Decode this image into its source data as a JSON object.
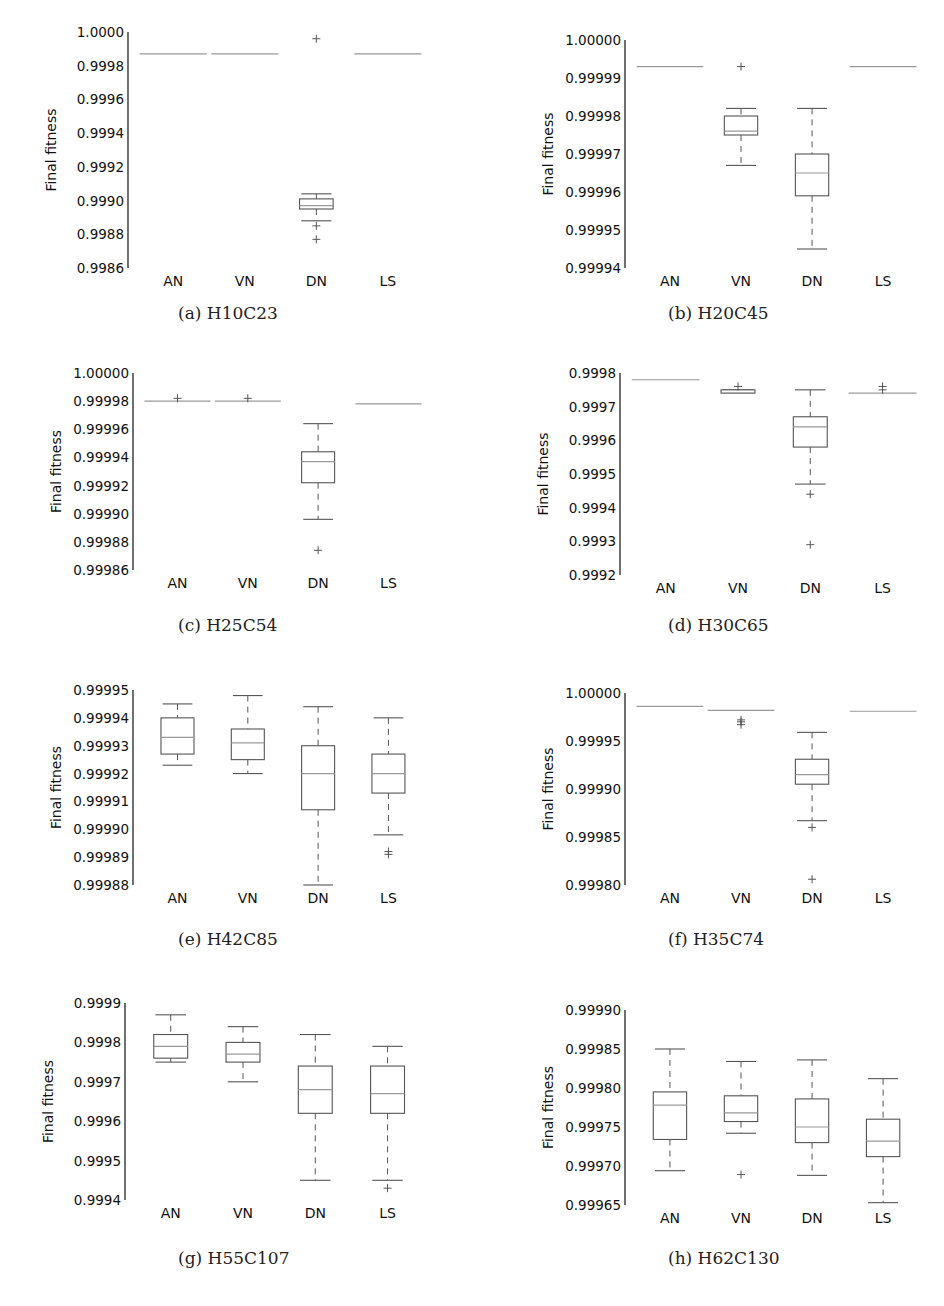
{
  "chart_data": [
    {
      "id": "a",
      "type": "box",
      "caption": "(a) H10C23",
      "ylabel": "Final fitness",
      "categories": [
        "AN",
        "VN",
        "DN",
        "LS"
      ],
      "yticks": [
        "0.9986",
        "0.9988",
        "0.9990",
        "0.9992",
        "0.9994",
        "0.9996",
        "0.9998",
        "1.0000"
      ],
      "ylim": [
        0.9986,
        1.0
      ],
      "boxes": [
        {
          "cat": "AN",
          "min": 0.99987,
          "q1": 0.99987,
          "median": 0.99987,
          "q3": 0.99987,
          "max": 0.99987,
          "outliers": []
        },
        {
          "cat": "VN",
          "min": 0.99987,
          "q1": 0.99987,
          "median": 0.99987,
          "q3": 0.99987,
          "max": 0.99987,
          "outliers": []
        },
        {
          "cat": "DN",
          "min": 0.99888,
          "q1": 0.99895,
          "median": 0.99897,
          "q3": 0.99901,
          "max": 0.99904,
          "outliers": [
            0.99885,
            0.99877,
            0.99996
          ]
        },
        {
          "cat": "LS",
          "min": 0.99987,
          "q1": 0.99987,
          "median": 0.99987,
          "q3": 0.99987,
          "max": 0.99987,
          "outliers": []
        }
      ]
    },
    {
      "id": "b",
      "type": "box",
      "caption": "(b) H20C45",
      "ylabel": "Final fitness",
      "categories": [
        "AN",
        "VN",
        "DN",
        "LS"
      ],
      "yticks": [
        "0.99994",
        "0.99995",
        "0.99996",
        "0.99997",
        "0.99998",
        "0.99999",
        "1.00000"
      ],
      "ylim": [
        0.99994,
        1.0
      ],
      "boxes": [
        {
          "cat": "AN",
          "min": 0.999993,
          "q1": 0.999993,
          "median": 0.999993,
          "q3": 0.999993,
          "max": 0.999993,
          "outliers": []
        },
        {
          "cat": "VN",
          "min": 0.999967,
          "q1": 0.999975,
          "median": 0.999976,
          "q3": 0.99998,
          "max": 0.999982,
          "outliers": [
            0.999993
          ]
        },
        {
          "cat": "DN",
          "min": 0.999945,
          "q1": 0.999959,
          "median": 0.999965,
          "q3": 0.99997,
          "max": 0.999982,
          "outliers": []
        },
        {
          "cat": "LS",
          "min": 0.999993,
          "q1": 0.999993,
          "median": 0.999993,
          "q3": 0.999993,
          "max": 0.999993,
          "outliers": []
        }
      ]
    },
    {
      "id": "c",
      "type": "box",
      "caption": "(c) H25C54",
      "ylabel": "Final fitness",
      "categories": [
        "AN",
        "VN",
        "DN",
        "LS"
      ],
      "yticks": [
        "0.99986",
        "0.99988",
        "0.99990",
        "0.99992",
        "0.99994",
        "0.99996",
        "0.99998",
        "1.00000"
      ],
      "ylim": [
        0.99986,
        1.0
      ],
      "boxes": [
        {
          "cat": "AN",
          "min": 0.99998,
          "q1": 0.99998,
          "median": 0.99998,
          "q3": 0.99998,
          "max": 0.99998,
          "outliers": [
            0.999982
          ]
        },
        {
          "cat": "VN",
          "min": 0.99998,
          "q1": 0.99998,
          "median": 0.99998,
          "q3": 0.99998,
          "max": 0.99998,
          "outliers": [
            0.999982
          ]
        },
        {
          "cat": "DN",
          "min": 0.999896,
          "q1": 0.999922,
          "median": 0.999937,
          "q3": 0.999944,
          "max": 0.999964,
          "outliers": [
            0.999874
          ]
        },
        {
          "cat": "LS",
          "min": 0.999978,
          "q1": 0.999978,
          "median": 0.999978,
          "q3": 0.999978,
          "max": 0.999978,
          "outliers": []
        }
      ]
    },
    {
      "id": "d",
      "type": "box",
      "caption": "(d) H30C65",
      "ylabel": "Final fitness",
      "categories": [
        "AN",
        "VN",
        "DN",
        "LS"
      ],
      "yticks": [
        "0.9992",
        "0.9993",
        "0.9994",
        "0.9995",
        "0.9996",
        "0.9997",
        "0.9998"
      ],
      "ylim": [
        0.9992,
        0.9998
      ],
      "boxes": [
        {
          "cat": "AN",
          "min": 0.99978,
          "q1": 0.99978,
          "median": 0.99978,
          "q3": 0.99978,
          "max": 0.99978,
          "outliers": []
        },
        {
          "cat": "VN",
          "min": 0.99974,
          "q1": 0.99974,
          "median": 0.99974,
          "q3": 0.99975,
          "max": 0.99975,
          "outliers": [
            0.99976
          ]
        },
        {
          "cat": "DN",
          "min": 0.99947,
          "q1": 0.99958,
          "median": 0.99964,
          "q3": 0.99967,
          "max": 0.99975,
          "outliers": [
            0.99944,
            0.99929
          ]
        },
        {
          "cat": "LS",
          "min": 0.99974,
          "q1": 0.99974,
          "median": 0.99974,
          "q3": 0.99974,
          "max": 0.99974,
          "outliers": [
            0.99976,
            0.99975
          ]
        }
      ]
    },
    {
      "id": "e",
      "type": "box",
      "caption": "(e) H42C85",
      "ylabel": "Final fitness",
      "categories": [
        "AN",
        "VN",
        "DN",
        "LS"
      ],
      "yticks": [
        "0.99988",
        "0.99989",
        "0.99990",
        "0.99991",
        "0.99992",
        "0.99993",
        "0.99994",
        "0.99995"
      ],
      "ylim": [
        0.99988,
        0.99995
      ],
      "boxes": [
        {
          "cat": "AN",
          "min": 0.999923,
          "q1": 0.999927,
          "median": 0.999933,
          "q3": 0.99994,
          "max": 0.999945,
          "outliers": []
        },
        {
          "cat": "VN",
          "min": 0.99992,
          "q1": 0.999925,
          "median": 0.999931,
          "q3": 0.999936,
          "max": 0.999948,
          "outliers": []
        },
        {
          "cat": "DN",
          "min": 0.99988,
          "q1": 0.999907,
          "median": 0.99992,
          "q3": 0.99993,
          "max": 0.999944,
          "outliers": []
        },
        {
          "cat": "LS",
          "min": 0.999898,
          "q1": 0.999913,
          "median": 0.99992,
          "q3": 0.999927,
          "max": 0.99994,
          "outliers": [
            0.999892,
            0.999891
          ]
        }
      ]
    },
    {
      "id": "f",
      "type": "box",
      "caption": "(f) H35C74",
      "ylabel": "Final fitness",
      "categories": [
        "AN",
        "VN",
        "DN",
        "LS"
      ],
      "yticks": [
        "0.99980",
        "0.99985",
        "0.99990",
        "0.99995",
        "1.00000"
      ],
      "ylim": [
        0.9998,
        1.0
      ],
      "boxes": [
        {
          "cat": "AN",
          "min": 0.999986,
          "q1": 0.999986,
          "median": 0.999986,
          "q3": 0.999986,
          "max": 0.999986,
          "outliers": []
        },
        {
          "cat": "VN",
          "min": 0.999982,
          "q1": 0.999982,
          "median": 0.999982,
          "q3": 0.999982,
          "max": 0.999982,
          "outliers": [
            0.999972,
            0.99997,
            0.999967
          ]
        },
        {
          "cat": "DN",
          "min": 0.999867,
          "q1": 0.999905,
          "median": 0.999915,
          "q3": 0.999931,
          "max": 0.999959,
          "outliers": [
            0.99986,
            0.999806
          ]
        },
        {
          "cat": "LS",
          "min": 0.999981,
          "q1": 0.999981,
          "median": 0.999981,
          "q3": 0.999981,
          "max": 0.999981,
          "outliers": []
        }
      ]
    },
    {
      "id": "g",
      "type": "box",
      "caption": "(g) H55C107",
      "ylabel": "Final fitness",
      "categories": [
        "AN",
        "VN",
        "DN",
        "LS"
      ],
      "yticks": [
        "0.9994",
        "0.9995",
        "0.9996",
        "0.9997",
        "0.9998",
        "0.9999"
      ],
      "ylim": [
        0.9994,
        0.9999
      ],
      "boxes": [
        {
          "cat": "AN",
          "min": 0.99975,
          "q1": 0.99976,
          "median": 0.99979,
          "q3": 0.99982,
          "max": 0.99987,
          "outliers": []
        },
        {
          "cat": "VN",
          "min": 0.9997,
          "q1": 0.99975,
          "median": 0.99977,
          "q3": 0.9998,
          "max": 0.99984,
          "outliers": []
        },
        {
          "cat": "DN",
          "min": 0.99945,
          "q1": 0.99962,
          "median": 0.99968,
          "q3": 0.99974,
          "max": 0.99982,
          "outliers": []
        },
        {
          "cat": "LS",
          "min": 0.99945,
          "q1": 0.99962,
          "median": 0.99967,
          "q3": 0.99974,
          "max": 0.99979,
          "outliers": [
            0.99943
          ]
        }
      ]
    },
    {
      "id": "h",
      "type": "box",
      "caption": "(h) H62C130",
      "ylabel": "Final fitness",
      "categories": [
        "AN",
        "VN",
        "DN",
        "LS"
      ],
      "yticks": [
        "0.99965",
        "0.99970",
        "0.99975",
        "0.99980",
        "0.99985",
        "0.99990"
      ],
      "ylim": [
        0.99965,
        0.9999
      ],
      "boxes": [
        {
          "cat": "AN",
          "min": 0.999694,
          "q1": 0.999734,
          "median": 0.999778,
          "q3": 0.999795,
          "max": 0.99985,
          "outliers": []
        },
        {
          "cat": "VN",
          "min": 0.999742,
          "q1": 0.999757,
          "median": 0.999768,
          "q3": 0.99979,
          "max": 0.999834,
          "outliers": [
            0.999689
          ]
        },
        {
          "cat": "DN",
          "min": 0.999688,
          "q1": 0.99973,
          "median": 0.99975,
          "q3": 0.999786,
          "max": 0.999836,
          "outliers": []
        },
        {
          "cat": "LS",
          "min": 0.999653,
          "q1": 0.999712,
          "median": 0.999732,
          "q3": 0.99976,
          "max": 0.999812,
          "outliers": []
        }
      ]
    }
  ],
  "layout_colors": {
    "box_stroke": "#555555",
    "median": "#999999",
    "whisker": "#555555",
    "axis": "#222222"
  }
}
